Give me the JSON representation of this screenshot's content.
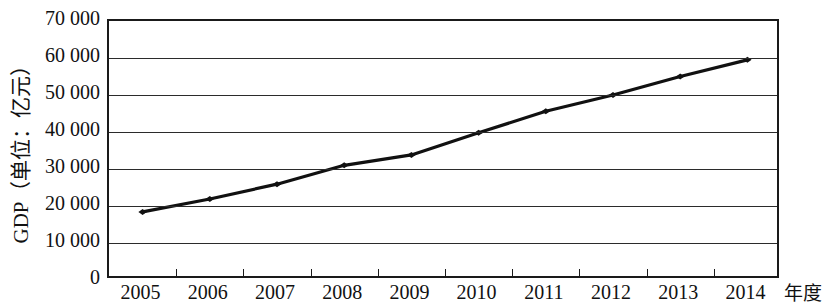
{
  "chart_data": {
    "type": "line",
    "title": "",
    "xlabel": "年度",
    "ylabel": "GDP（单位：亿元）",
    "categories": [
      "2005",
      "2006",
      "2007",
      "2008",
      "2009",
      "2010",
      "2011",
      "2012",
      "2013",
      "2014"
    ],
    "values": [
      18400,
      21900,
      25900,
      31000,
      33800,
      39800,
      45600,
      50000,
      55000,
      59500
    ],
    "series": [
      {
        "name": "GDP",
        "values": [
          18400,
          21900,
          25900,
          31000,
          33800,
          39800,
          45600,
          50000,
          55000,
          59500
        ]
      }
    ],
    "ylim": [
      0,
      70000
    ],
    "ytick_values": [
      70000,
      60000,
      50000,
      40000,
      30000,
      20000,
      10000,
      0
    ],
    "ytick_labels": [
      "70 000",
      "60 000",
      "50 000",
      "40 000",
      "30 000",
      "20 000",
      "10 000",
      "0"
    ],
    "grid": "horizontal",
    "legend": "none",
    "line_color": "#111111",
    "marker": "diamond",
    "axis_color": "#1a1a1a",
    "background": "#ffffff"
  }
}
